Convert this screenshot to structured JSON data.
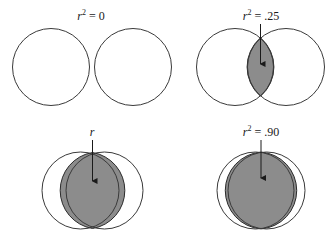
{
  "diagram": {
    "type": "venn-overlap",
    "colors": {
      "stroke": "#3a3a3a",
      "overlap_fill": "#8c8c8c",
      "background": "#ffffff"
    },
    "panels": [
      {
        "label_var": "r",
        "label_exp": "2",
        "label_eq": " = 0",
        "r_squared": 0
      },
      {
        "label_var": "r",
        "label_exp": "2",
        "label_eq": " = .25",
        "r_squared": 0.25
      },
      {
        "label_var": "r",
        "label_exp": "2",
        "label_eq": " = .75",
        "r_squared": 0.75
      },
      {
        "label_var": "r",
        "label_exp": "2",
        "label_eq": " = .90",
        "r_squared": 0.9
      }
    ]
  }
}
